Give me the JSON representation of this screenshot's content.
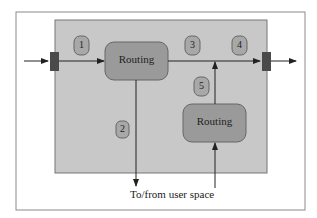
{
  "diagram": {
    "nodes": [
      {
        "id": "routing-1",
        "label": "Routing"
      },
      {
        "id": "routing-2",
        "label": "Routing"
      }
    ],
    "badges": [
      "1",
      "2",
      "3",
      "4",
      "5"
    ],
    "bottom_label": "To/from user space",
    "colors": {
      "frame_border": "#8a8a8a",
      "kernel_box": "#c8c8c8",
      "routing_box": "#9a9a9a",
      "badge": "#a8a8a8",
      "port": "#4a4a4a",
      "arrow": "#222222"
    }
  }
}
